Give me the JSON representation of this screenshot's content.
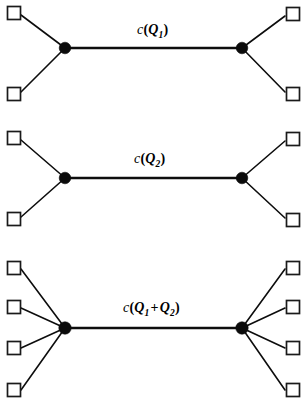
{
  "figure": {
    "background_color": "#ffffff",
    "stroke_color": "#0d0d0d",
    "node_fill_color": "#0b0b0b",
    "terminal_fill_color": "#ffffff",
    "width": 306,
    "height": 405
  },
  "panels": [
    {
      "id": "panel-1",
      "label_text": "c(Q1)",
      "label_function": "c",
      "label_arg": "Q",
      "label_subscript": "1",
      "left_terminal_count": 2,
      "right_terminal_count": 2,
      "left_hub": {
        "x": 65,
        "y": 48
      },
      "right_hub": {
        "x": 242,
        "y": 48
      },
      "left_terminals_y": [
        13,
        94
      ],
      "right_terminals_y": [
        14,
        94
      ],
      "label_pos": {
        "x": 137,
        "y": 22
      }
    },
    {
      "id": "panel-2",
      "label_text": "c(Q2)",
      "label_function": "c",
      "label_arg": "Q",
      "label_subscript": "2",
      "left_terminal_count": 2,
      "right_terminal_count": 2,
      "left_hub": {
        "x": 65,
        "y": 178
      },
      "right_hub": {
        "x": 242,
        "y": 178
      },
      "left_terminals_y": [
        138,
        219
      ],
      "right_terminals_y": [
        139,
        220
      ],
      "label_pos": {
        "x": 134,
        "y": 151
      }
    },
    {
      "id": "panel-3",
      "label_text": "c(Q1 + Q2)",
      "label_function": "c",
      "label_arg_1": "Q",
      "label_subscript_1": "1",
      "label_operator": "+",
      "label_arg_2": "Q",
      "label_subscript_2": "2",
      "left_terminal_count": 4,
      "right_terminal_count": 4,
      "left_hub": {
        "x": 65,
        "y": 328
      },
      "right_hub": {
        "x": 242,
        "y": 328
      },
      "left_terminals_y": [
        267,
        306,
        347,
        389
      ],
      "right_terminals_y": [
        267,
        306,
        347,
        389
      ],
      "label_pos": {
        "x": 123,
        "y": 300
      }
    }
  ],
  "geometry": {
    "terminal_size": 13,
    "left_terminal_x": 7,
    "right_terminal_x": 286,
    "hub_radius": 5.8
  }
}
